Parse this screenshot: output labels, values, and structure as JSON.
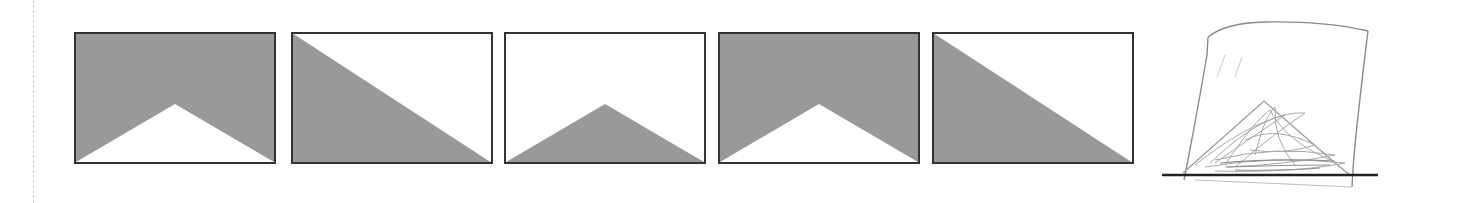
{
  "figure": {
    "colors": {
      "fill": "#999999",
      "background": "#ffffff",
      "border": "#333333",
      "sketch_stroke": "#8a8a8a",
      "sketch_scribble": "#a8a8a8",
      "baseline": "#222222"
    },
    "panels": [
      {
        "id": 1,
        "left": 74,
        "shape": "gray-with-white-bottom-triangle"
      },
      {
        "id": 2,
        "left": 291,
        "shape": "gray-lower-left-diagonal"
      },
      {
        "id": 3,
        "left": 504,
        "shape": "gray-bottom-triangle"
      },
      {
        "id": 4,
        "left": 718,
        "shape": "gray-with-white-bottom-triangle"
      },
      {
        "id": 5,
        "left": 932,
        "shape": "gray-lower-left-diagonal"
      }
    ],
    "sketch": {
      "description": "hand-drawn frame with scribbled triangle on baseline"
    }
  }
}
